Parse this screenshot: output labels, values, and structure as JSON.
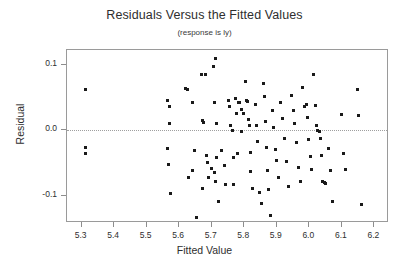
{
  "chart_data": {
    "type": "scatter",
    "title": "Residuals Versus the Fitted Values",
    "subtitle": "(response is ly)",
    "xlabel": "Fitted Value",
    "ylabel": "Residual",
    "xlim": [
      5.255,
      6.245
    ],
    "ylim": [
      -0.142,
      0.123
    ],
    "xticks": [
      "5.3",
      "5.4",
      "5.5",
      "5.6",
      "5.7",
      "5.8",
      "5.9",
      "6.0",
      "6.1",
      "6.2"
    ],
    "xtick_values": [
      5.3,
      5.4,
      5.5,
      5.6,
      5.7,
      5.8,
      5.9,
      6.0,
      6.1,
      6.2
    ],
    "yticks": [
      "0.1",
      "0.0",
      "-0.1"
    ],
    "ytick_values": [
      0.1,
      0.0,
      -0.1
    ],
    "grid": false,
    "legend": false,
    "reference_line": {
      "y": 0.0,
      "style": "dotted",
      "color": "#9f9f9f"
    },
    "marker": {
      "shape": "square",
      "size": 3,
      "color": "#1a1a1a"
    },
    "points": [
      [
        5.312,
        0.063
      ],
      [
        5.313,
        -0.027
      ],
      [
        5.313,
        -0.035
      ],
      [
        5.565,
        0.045
      ],
      [
        5.571,
        0.037
      ],
      [
        5.569,
        0.011
      ],
      [
        5.565,
        -0.028
      ],
      [
        5.567,
        -0.052
      ],
      [
        5.572,
        -0.097
      ],
      [
        5.619,
        0.064
      ],
      [
        5.624,
        0.063
      ],
      [
        5.64,
        0.043
      ],
      [
        5.648,
        -0.031
      ],
      [
        5.64,
        -0.061
      ],
      [
        5.629,
        -0.073
      ],
      [
        5.652,
        -0.134
      ],
      [
        5.668,
        0.085
      ],
      [
        5.673,
        0.015
      ],
      [
        5.675,
        0.012
      ],
      [
        5.68,
        0.085
      ],
      [
        5.683,
        -0.038
      ],
      [
        5.688,
        -0.049
      ],
      [
        5.69,
        -0.073
      ],
      [
        5.672,
        -0.089
      ],
      [
        5.698,
        -0.058
      ],
      [
        5.706,
        0.098
      ],
      [
        5.712,
        0.11
      ],
      [
        5.708,
        0.042
      ],
      [
        5.714,
        0.01
      ],
      [
        5.716,
        -0.042
      ],
      [
        5.709,
        -0.065
      ],
      [
        5.713,
        -0.079
      ],
      [
        5.72,
        -0.109
      ],
      [
        5.731,
        -0.031
      ],
      [
        5.738,
        -0.054
      ],
      [
        5.741,
        -0.083
      ],
      [
        5.752,
        0.046
      ],
      [
        5.755,
        0.037
      ],
      [
        5.759,
        0.008
      ],
      [
        5.763,
        -0.001
      ],
      [
        5.766,
        -0.041
      ],
      [
        5.768,
        -0.083
      ],
      [
        5.773,
        0.049
      ],
      [
        5.777,
        0.025
      ],
      [
        5.782,
        0.043
      ],
      [
        5.786,
        0.042
      ],
      [
        5.78,
        -0.036
      ],
      [
        5.79,
        0.032
      ],
      [
        5.792,
        -0.002
      ],
      [
        5.798,
        0.025
      ],
      [
        5.803,
        0.074
      ],
      [
        5.806,
        0.046
      ],
      [
        5.81,
        0.044
      ],
      [
        5.812,
        0.016
      ],
      [
        5.815,
        0.008
      ],
      [
        5.818,
        -0.034
      ],
      [
        5.82,
        -0.063
      ],
      [
        5.825,
        -0.089
      ],
      [
        5.836,
        0.04
      ],
      [
        5.839,
        0.007
      ],
      [
        5.842,
        -0.017
      ],
      [
        5.846,
        -0.095
      ],
      [
        5.852,
        -0.112
      ],
      [
        5.858,
        0.072
      ],
      [
        5.862,
        0.052
      ],
      [
        5.866,
        0.013
      ],
      [
        5.869,
        -0.026
      ],
      [
        5.872,
        -0.062
      ],
      [
        5.875,
        -0.091
      ],
      [
        5.88,
        -0.131
      ],
      [
        5.886,
        0.031
      ],
      [
        5.89,
        0.004
      ],
      [
        5.895,
        -0.029
      ],
      [
        5.9,
        -0.046
      ],
      [
        5.906,
        -0.073
      ],
      [
        5.912,
        0.043
      ],
      [
        5.918,
        0.018
      ],
      [
        5.923,
        -0.012
      ],
      [
        5.929,
        -0.048
      ],
      [
        5.935,
        -0.086
      ],
      [
        5.946,
        0.053
      ],
      [
        5.95,
        0.03
      ],
      [
        5.955,
        0.01
      ],
      [
        5.96,
        -0.019
      ],
      [
        5.966,
        -0.057
      ],
      [
        5.972,
        -0.079
      ],
      [
        5.98,
        0.066
      ],
      [
        5.985,
        0.037
      ],
      [
        5.99,
        0.04
      ],
      [
        5.995,
        0.019
      ],
      [
        5.999,
        -0.014
      ],
      [
        6.003,
        -0.04
      ],
      [
        6.008,
        -0.06
      ],
      [
        6.012,
        0.085
      ],
      [
        6.018,
        0.038
      ],
      [
        6.022,
        0.008
      ],
      [
        6.026,
        0.0
      ],
      [
        6.03,
        -0.002
      ],
      [
        6.034,
        -0.012
      ],
      [
        6.038,
        -0.039
      ],
      [
        6.042,
        -0.078
      ],
      [
        6.046,
        -0.08
      ],
      [
        6.05,
        -0.082
      ],
      [
        6.058,
        -0.028
      ],
      [
        6.064,
        -0.061
      ],
      [
        6.072,
        -0.109
      ],
      [
        6.098,
        0.024
      ],
      [
        6.104,
        -0.035
      ],
      [
        6.11,
        -0.06
      ],
      [
        6.148,
        0.062
      ],
      [
        6.152,
        0.023
      ],
      [
        6.16,
        -0.113
      ]
    ]
  }
}
